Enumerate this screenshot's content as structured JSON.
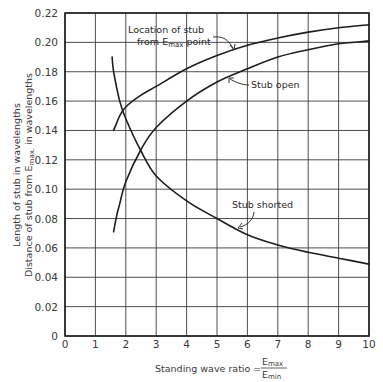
{
  "chart_data": {
    "type": "line",
    "title": "",
    "xlabel": "Standing wave ratio = Emax / Emin",
    "xlabel_parts": {
      "prefix": "Standing wave ratio =",
      "num_main": "E",
      "num_sub": "max",
      "den_main": "E",
      "den_sub": "min"
    },
    "ylabel_lines": [
      "Length of stub in wavelengths",
      "Distance of stub from Emax. in wavelengths"
    ],
    "ylabel_parts": {
      "line1": "Length of stub in wavelengths",
      "line2_prefix": "Distance of stub from E",
      "line2_sub": "max.",
      "line2_suffix": " in wavelengths"
    },
    "xlim": [
      0,
      10
    ],
    "ylim": [
      0,
      0.22
    ],
    "grid": true,
    "legend": "none (curves labeled by annotations)",
    "x_ticks": [
      "0",
      "1",
      "2",
      "3",
      "4",
      "5",
      "6",
      "7",
      "8",
      "9",
      "10"
    ],
    "y_ticks": [
      "0",
      "0.02",
      "0.04",
      "0.06",
      "0.08",
      "0.10",
      "0.12",
      "0.14",
      "0.16",
      "0.18",
      "0.20",
      "0.22"
    ],
    "series": [
      {
        "name": "Location of stub from Emax point",
        "x": [
          1.6,
          1.8,
          2.0,
          2.5,
          3,
          4,
          5,
          6,
          7,
          8,
          9,
          10
        ],
        "values": [
          0.14,
          0.15,
          0.156,
          0.164,
          0.17,
          0.182,
          0.191,
          0.198,
          0.203,
          0.207,
          0.21,
          0.212
        ]
      },
      {
        "name": "Stub open",
        "x": [
          1.6,
          1.7,
          1.8,
          2.0,
          2.5,
          3,
          4,
          5,
          6,
          7,
          8,
          9,
          10
        ],
        "values": [
          0.071,
          0.082,
          0.09,
          0.105,
          0.127,
          0.142,
          0.16,
          0.173,
          0.182,
          0.19,
          0.195,
          0.199,
          0.201
        ]
      },
      {
        "name": "Stub shorted",
        "x": [
          1.55,
          1.6,
          1.8,
          2.0,
          2.5,
          3,
          4,
          5,
          6,
          7,
          8,
          9,
          10
        ],
        "values": [
          0.19,
          0.18,
          0.16,
          0.148,
          0.126,
          0.109,
          0.092,
          0.08,
          0.069,
          0.062,
          0.057,
          0.053,
          0.049
        ]
      }
    ],
    "annotations": [
      {
        "text_line1": "Location of stub",
        "text_line2_prefix": "from E",
        "text_line2_sub": "max",
        "text_line2_suffix": " point",
        "target_series": "Location of stub from Emax point"
      },
      {
        "text": "Stub open",
        "target_series": "Stub open"
      },
      {
        "text": "Stub shorted",
        "target_series": "Stub shorted"
      }
    ],
    "colors": {
      "line": "#1e1e1e",
      "grid": "#3a3a3a",
      "text": "#2a2a2a",
      "background": "#ffffff"
    }
  }
}
